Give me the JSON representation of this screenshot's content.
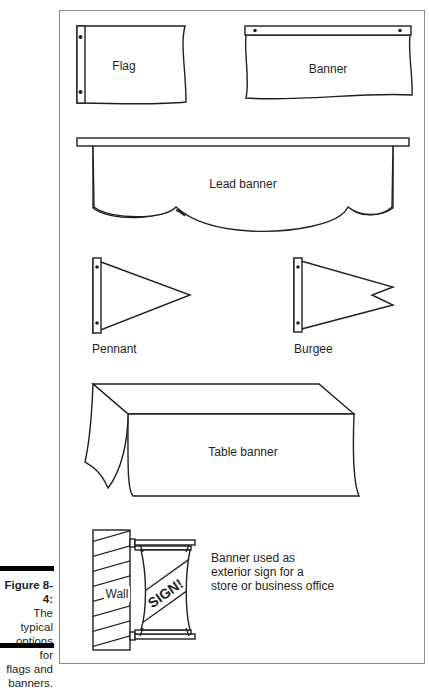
{
  "caption": {
    "figure_number": "Figure 8-4:",
    "text_lines": [
      "The typical",
      "options for",
      "flags and",
      "banners."
    ]
  },
  "illustration": {
    "items": [
      {
        "id": "flag",
        "label": "Flag"
      },
      {
        "id": "banner",
        "label": "Banner"
      },
      {
        "id": "lead-banner",
        "label": "Lead banner"
      },
      {
        "id": "pennant",
        "label": "Pennant"
      },
      {
        "id": "burgee",
        "label": "Burgee"
      },
      {
        "id": "table-banner",
        "label": "Table banner"
      },
      {
        "id": "exterior-sign",
        "wall_label": "Wall",
        "sign_text": "SIGN!",
        "description_lines": [
          "Banner used as",
          "exterior sign for a",
          "store or business office"
        ]
      }
    ]
  },
  "colors": {
    "ink": "#231f20",
    "frame_border": "#8a8a8a",
    "background": "#ffffff"
  }
}
